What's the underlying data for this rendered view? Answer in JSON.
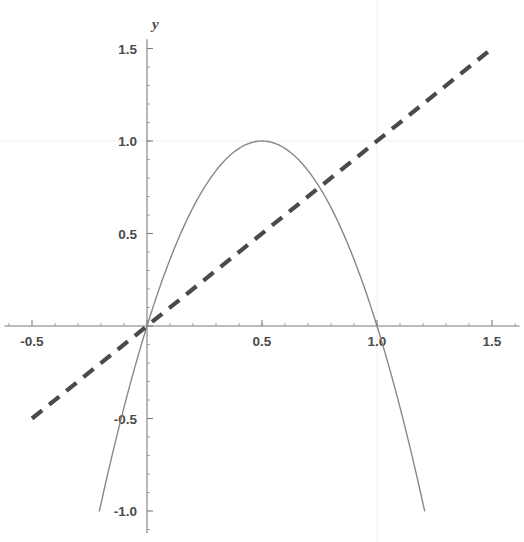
{
  "chart_data": {
    "type": "line",
    "title": "",
    "xlabel": "x",
    "ylabel": "y",
    "xlim": [
      -0.62,
      1.62
    ],
    "ylim": [
      -1.12,
      1.55
    ],
    "grid": true,
    "grid_style": "faint gridlines at x=1.0 and y=1.0",
    "legend": "none",
    "axes_style": "centered cross axes at origin with major and minor ticks",
    "x_ticks": [
      {
        "value": -0.5,
        "label": "-0.5"
      },
      {
        "value": 0,
        "label": ""
      },
      {
        "value": 0.5,
        "label": "0.5"
      },
      {
        "value": 1.0,
        "label": "1.0"
      },
      {
        "value": 1.5,
        "label": "1.5"
      }
    ],
    "y_ticks": [
      {
        "value": 1.5,
        "label": "1.5"
      },
      {
        "value": 1.0,
        "label": "1.0"
      },
      {
        "value": 0.5,
        "label": "0.5"
      },
      {
        "value": 0,
        "label": ""
      },
      {
        "value": -0.5,
        "label": "-0.5"
      },
      {
        "value": -1.0,
        "label": "-1.0"
      }
    ],
    "x_minor_step": 0.1,
    "y_minor_step": 0.1,
    "series": [
      {
        "name": "parabola",
        "style": "solid",
        "color": "#888888",
        "expression": "y = 4x(1 - x)",
        "x_range": [
          -0.207,
          1.207
        ],
        "points": [
          {
            "x": -0.207,
            "y": -1.0
          },
          {
            "x": -0.15,
            "y": -0.69
          },
          {
            "x": -0.1,
            "y": -0.44
          },
          {
            "x": -0.05,
            "y": -0.21
          },
          {
            "x": 0.0,
            "y": 0.0
          },
          {
            "x": 0.1,
            "y": 0.36
          },
          {
            "x": 0.2,
            "y": 0.64
          },
          {
            "x": 0.3,
            "y": 0.84
          },
          {
            "x": 0.4,
            "y": 0.96
          },
          {
            "x": 0.5,
            "y": 1.0
          },
          {
            "x": 0.6,
            "y": 0.96
          },
          {
            "x": 0.7,
            "y": 0.84
          },
          {
            "x": 0.8,
            "y": 0.64
          },
          {
            "x": 0.9,
            "y": 0.36
          },
          {
            "x": 1.0,
            "y": 0.0
          },
          {
            "x": 1.05,
            "y": -0.21
          },
          {
            "x": 1.1,
            "y": -0.44
          },
          {
            "x": 1.15,
            "y": -0.69
          },
          {
            "x": 1.207,
            "y": -1.0
          }
        ]
      },
      {
        "name": "identity-line",
        "style": "dashed",
        "color": "#4a4a4a",
        "expression": "y = x",
        "x_range": [
          -0.5,
          1.5
        ],
        "points": [
          {
            "x": -0.5,
            "y": -0.5
          },
          {
            "x": 1.5,
            "y": 1.5
          }
        ]
      }
    ],
    "intersections": [
      {
        "x": 0.0,
        "y": 0.0
      },
      {
        "x": 0.75,
        "y": 0.75
      }
    ]
  }
}
